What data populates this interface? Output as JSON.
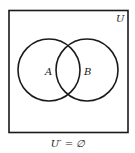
{
  "diagram": {
    "type": "venn",
    "universe_label": "U",
    "sets": [
      {
        "label": "A",
        "cx": 49,
        "cy": 70,
        "r": 31
      },
      {
        "label": "B",
        "cx": 87,
        "cy": 70,
        "r": 31
      }
    ],
    "caption": "U′ = ∅",
    "colors": {
      "stroke": "#1a1a1a",
      "background": "#ffffff"
    }
  }
}
